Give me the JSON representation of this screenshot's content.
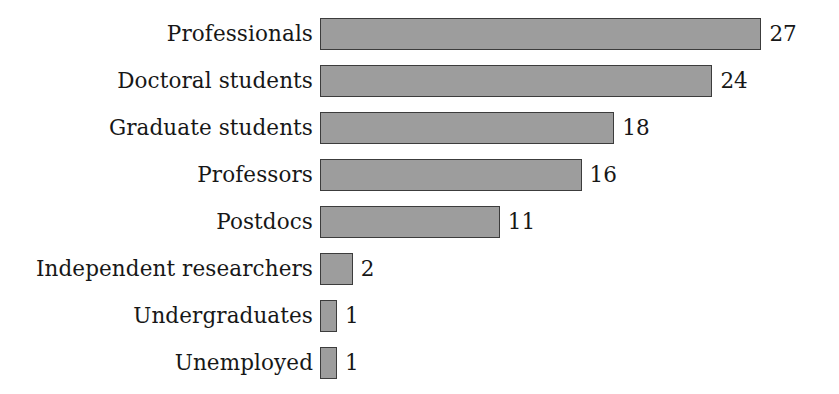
{
  "chart_data": {
    "type": "bar",
    "orientation": "horizontal",
    "title": "",
    "subtitle": "",
    "xlabel": "",
    "ylabel": "",
    "categories": [
      "Professionals",
      "Doctoral students",
      "Graduate students",
      "Professors",
      "Postdocs",
      "Independent researchers",
      "Undergraduates",
      "Unemployed"
    ],
    "values": [
      27,
      24,
      18,
      16,
      11,
      2,
      1,
      1
    ],
    "value_labels": [
      "27",
      "24",
      "18",
      "16",
      "11",
      "2",
      "1",
      "1"
    ],
    "xlim": [
      0,
      27
    ],
    "grid": false,
    "axis_visible": false,
    "tick_labels": [],
    "legend": null,
    "legend_position": "none",
    "data_labels_shown": true,
    "bar_fill_color": "#9d9d9d",
    "bar_border_color": "#3c3c3c",
    "background_color": "#ffffff",
    "text_color": "#171717",
    "series": [
      {
        "name": "Respondents",
        "values": [
          27,
          24,
          18,
          16,
          11,
          2,
          1,
          1
        ]
      }
    ],
    "points": [
      {
        "category": "Professionals",
        "value": 27,
        "label": "27"
      },
      {
        "category": "Doctoral students",
        "value": 24,
        "label": "24"
      },
      {
        "category": "Graduate students",
        "value": 18,
        "label": "18"
      },
      {
        "category": "Professors",
        "value": 16,
        "label": "16"
      },
      {
        "category": "Postdocs",
        "value": 11,
        "label": "11"
      },
      {
        "category": "Independent researchers",
        "value": 2,
        "label": "2"
      },
      {
        "category": "Undergraduates",
        "value": 1,
        "label": "1"
      },
      {
        "category": "Unemployed",
        "value": 1,
        "label": "1"
      }
    ]
  },
  "layout": {
    "bar_origin_x": 320,
    "px_per_unit": 16.35,
    "bar_height": 32,
    "row_pitch": 47,
    "first_row_top": 18,
    "label_gap": 8,
    "min_bar_width": 17
  }
}
